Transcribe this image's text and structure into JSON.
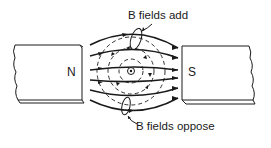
{
  "diagram": {
    "labels": {
      "top": "B fields add",
      "bottom": "B fields oppose"
    },
    "magnets": {
      "left_pole": "N",
      "right_pole": "S"
    },
    "conductor_symbol": "current-out-of-page-dot",
    "colors": {
      "ink": "#1a1a1a",
      "background": "#ffffff"
    }
  }
}
